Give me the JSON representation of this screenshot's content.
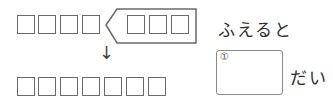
{
  "problem": {
    "top_row_boxes": 4,
    "flag_boxes": 3,
    "bottom_row_boxes": 7,
    "arrow_glyph": "↓",
    "increase_text": "ふえると",
    "answer_label": "①",
    "unit_text": "だい"
  }
}
